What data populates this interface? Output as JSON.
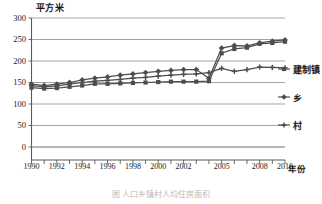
{
  "chart_data": {
    "type": "line",
    "title": "",
    "xlabel": "年份",
    "ylabel": "平方米",
    "grid": true,
    "legend_position": "right",
    "ylim": [
      0,
      300
    ],
    "yticks": [
      0,
      50,
      100,
      150,
      200,
      250,
      300
    ],
    "categories": [
      "1990",
      "1991",
      "1992",
      "1993",
      "1994",
      "1995",
      "1996",
      "1997",
      "1998",
      "1999",
      "2000",
      "2001",
      "2002",
      "2003",
      "2004",
      "2005",
      "2006",
      "2007",
      "2008",
      "2009",
      "2010"
    ],
    "xtick_labels": [
      "1990",
      "1992",
      "1994",
      "1996",
      "1998",
      "2000",
      "2002",
      "2005",
      "2008",
      "2010"
    ],
    "series": [
      {
        "name": "建制镇",
        "marker": "square",
        "color": "#4d4d4d",
        "values": [
          138,
          136,
          137,
          140,
          143,
          147,
          147,
          148,
          149,
          150,
          151,
          152,
          152,
          152,
          153,
          218,
          228,
          231,
          240,
          242,
          245
        ]
      },
      {
        "name": "乡",
        "marker": "diamond",
        "color": "#4d4d4d",
        "values": [
          146,
          143,
          146,
          150,
          156,
          160,
          163,
          167,
          170,
          173,
          176,
          178,
          180,
          180,
          160,
          230,
          236,
          235,
          242,
          246,
          249
        ]
      },
      {
        "name": "村",
        "marker": "cross",
        "color": "#4d4d4d",
        "values": [
          143,
          140,
          142,
          146,
          150,
          153,
          155,
          157,
          160,
          162,
          165,
          167,
          169,
          170,
          173,
          183,
          176,
          180,
          186,
          185,
          184
        ]
      }
    ]
  },
  "legend": {
    "items": [
      {
        "label": "建制镇",
        "marker": "square"
      },
      {
        "label": "乡",
        "marker": "diamond"
      },
      {
        "label": "村",
        "marker": "cross"
      }
    ]
  },
  "caption": {
    "text": "图   人口乡镇村人均住房面积"
  }
}
